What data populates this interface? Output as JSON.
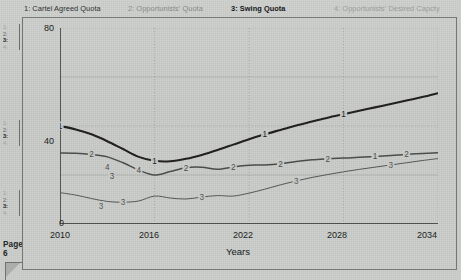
{
  "legend": {
    "items": [
      {
        "id": "1",
        "label": "1: Cartel Agreed Quota",
        "state": "normal",
        "color": "#2e3230"
      },
      {
        "id": "2",
        "label": "2: Opportunists' Quota",
        "state": "dim",
        "color": "#878a88"
      },
      {
        "id": "3",
        "label": "3: Swing Quota",
        "state": "active",
        "color": "#15181a"
      },
      {
        "id": "4",
        "label": "4: Opportunists' Desired Capcty",
        "state": "dim",
        "color": "#9a9d9b"
      }
    ]
  },
  "sidebar": {
    "marker_groups": [
      {
        "markers": [
          "1:",
          "2:",
          "3:",
          "4:"
        ],
        "active_index": 2
      },
      {
        "markers": [
          "1:",
          "2:",
          "3:",
          "4:"
        ],
        "active_index": 2
      },
      {
        "markers": [
          "1:",
          "2:",
          "3:",
          "4:"
        ],
        "active_index": 2
      }
    ],
    "page_label": "Page 6"
  },
  "chart_data": {
    "type": "line",
    "title": "",
    "xlabel": "Years",
    "ylabel": "",
    "xlim": [
      2010,
      2034
    ],
    "ylim": [
      0,
      80
    ],
    "xticks": [
      2010,
      2016,
      2022,
      2028,
      2034
    ],
    "yticks": [
      0,
      40,
      80
    ],
    "yminorticks": [
      20,
      60
    ],
    "grid": true,
    "legend_position": "top",
    "series": [
      {
        "name": "1: Cartel Agreed Quota",
        "id": "1",
        "color": "#22211f",
        "width": 2.1,
        "inline_labels": [
          "1",
          "1",
          "1",
          "1",
          "1"
        ],
        "x": [
          2010,
          2011,
          2012,
          2013,
          2014,
          2015,
          2016,
          2017,
          2018,
          2019,
          2020,
          2021,
          2022,
          2023,
          2024,
          2025,
          2026,
          2027,
          2028,
          2029,
          2030,
          2031,
          2032,
          2033,
          2034
        ],
        "values": [
          40.0,
          38.6,
          36.6,
          33.8,
          30.6,
          27.4,
          25.8,
          25.6,
          26.6,
          28.2,
          30.2,
          32.4,
          34.6,
          36.6,
          38.4,
          40.2,
          41.8,
          43.4,
          44.8,
          46.2,
          47.6,
          49.0,
          50.4,
          51.8,
          53.4
        ]
      },
      {
        "name": "2: Opportunists' Quota",
        "id": "2",
        "color": "#4a4d4b",
        "width": 1.5,
        "inline_labels": [
          "2",
          "4",
          "2",
          "2",
          "2",
          "2",
          "1"
        ],
        "x": [
          2010,
          2011,
          2012,
          2013,
          2014,
          2015,
          2016,
          2017,
          2018,
          2019,
          2020,
          2021,
          2022,
          2023,
          2024,
          2025,
          2026,
          2027,
          2028,
          2029,
          2030,
          2031,
          2032,
          2033,
          2034
        ],
        "values": [
          29.0,
          28.9,
          28.4,
          27.4,
          25.0,
          22.0,
          20.0,
          21.4,
          23.0,
          23.2,
          22.3,
          23.3,
          24.0,
          24.1,
          24.6,
          25.5,
          26.2,
          26.6,
          26.9,
          27.2,
          27.6,
          28.0,
          28.4,
          28.8,
          29.1
        ]
      },
      {
        "name": "3: Swing Quota",
        "id": "3",
        "color": "#555856",
        "width": 1.0,
        "inline_labels": [
          "3",
          "3",
          "3",
          "3",
          "3"
        ],
        "x": [
          2010,
          2011,
          2012,
          2013,
          2014,
          2015,
          2016,
          2017,
          2018,
          2019,
          2020,
          2021,
          2022,
          2023,
          2024,
          2025,
          2026,
          2027,
          2028,
          2029,
          2030,
          2031,
          2032,
          2033,
          2034
        ],
        "values": [
          12.8,
          11.8,
          10.4,
          9.2,
          8.9,
          9.4,
          11.4,
          10.6,
          10.2,
          11.0,
          11.6,
          11.4,
          12.6,
          14.2,
          16.0,
          17.6,
          19.0,
          20.2,
          21.3,
          22.3,
          23.2,
          24.1,
          25.0,
          25.9,
          26.7
        ]
      }
    ],
    "axis_tick_labels_x": [
      "2010",
      "2016",
      "2022",
      "2028",
      "2034"
    ],
    "axis_tick_labels_y": [
      "0",
      "40",
      "80"
    ]
  },
  "axis": {
    "y": {
      "t80": "80",
      "t40": "40",
      "t0": "0"
    },
    "x": {
      "t2010": "2010",
      "t2016": "2016",
      "t2022": "2022",
      "t2028": "2028",
      "t2034": "2034"
    },
    "xtitle": "Years"
  },
  "colors": {
    "background": "#c9cbc9",
    "axis": "#262927",
    "grid": "#8d908e",
    "series1": "#22211f",
    "series2": "#4a4d4b",
    "series3": "#555856"
  }
}
